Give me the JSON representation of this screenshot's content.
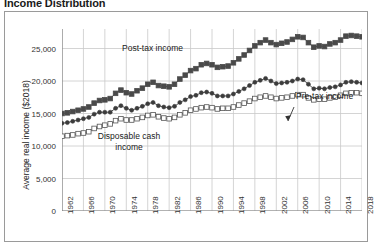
{
  "chart": {
    "title": "Income Distribution",
    "ylabel": "Average real income ($2018)",
    "xlabel": ""
  },
  "annotations": {
    "post_tax": "Post-tax income",
    "pre_tax": "Pre-tax income",
    "disposable": "Disposable cash income"
  },
  "axes": {
    "y_ticks": [
      "0",
      "5,000",
      "10,000",
      "15,000",
      "20,000",
      "25,000"
    ],
    "x_ticks": [
      "1962",
      "1966",
      "1970",
      "1974",
      "1978",
      "1982",
      "1986",
      "1990",
      "1994",
      "1998",
      "2002",
      "2006",
      "2010",
      "2014",
      "2018"
    ]
  },
  "colors": {
    "post_tax": "#4a4a4a",
    "pre_tax": "#3c3c3c",
    "disposable": "#ffffff",
    "disposable_stroke": "#555555",
    "grid": "#c9c9c9",
    "axis": "#7a7a7a",
    "frame": "#9a9a9a"
  },
  "chart_data": {
    "type": "line",
    "title": "Income Distribution",
    "xlabel": "",
    "ylabel": "Average real income ($2018)",
    "ylim": [
      0,
      28000
    ],
    "xlim": [
      1962,
      2018
    ],
    "grid": true,
    "legend": "annotations-inline",
    "markers": {
      "post_tax": "filled-square",
      "pre_tax": "filled-circle",
      "disposable": "open-square"
    },
    "x": [
      1962,
      1963,
      1964,
      1965,
      1966,
      1967,
      1968,
      1969,
      1970,
      1971,
      1972,
      1973,
      1974,
      1975,
      1976,
      1977,
      1978,
      1979,
      1980,
      1981,
      1982,
      1983,
      1984,
      1985,
      1986,
      1987,
      1988,
      1989,
      1990,
      1991,
      1992,
      1993,
      1994,
      1995,
      1996,
      1997,
      1998,
      1999,
      2000,
      2001,
      2002,
      2003,
      2004,
      2005,
      2006,
      2007,
      2008,
      2009,
      2010,
      2011,
      2012,
      2013,
      2014,
      2015,
      2016,
      2017,
      2018
    ],
    "series": [
      {
        "name": "Post-tax income",
        "values": [
          15000,
          15100,
          15300,
          15500,
          15700,
          16000,
          16600,
          17000,
          17100,
          17300,
          18100,
          18600,
          18200,
          18000,
          18500,
          18900,
          19500,
          19800,
          19300,
          19200,
          19100,
          19500,
          20300,
          20900,
          21600,
          21900,
          22500,
          22700,
          22500,
          22100,
          22200,
          22300,
          22800,
          23400,
          24000,
          24700,
          25400,
          25900,
          26300,
          25900,
          25600,
          25800,
          26000,
          26400,
          26800,
          26700,
          25900,
          25200,
          25400,
          25300,
          25700,
          25900,
          26300,
          26900,
          27000,
          26900,
          26800
        ]
      },
      {
        "name": "Pre-tax income",
        "values": [
          13500,
          13600,
          13800,
          14000,
          14200,
          14400,
          14900,
          15200,
          15200,
          15200,
          15800,
          16200,
          15800,
          15500,
          15800,
          16100,
          16500,
          16700,
          16200,
          16000,
          15900,
          16100,
          16700,
          17100,
          17600,
          17800,
          18200,
          18300,
          18100,
          17700,
          17700,
          17700,
          18000,
          18400,
          18800,
          19300,
          19800,
          20100,
          20400,
          20000,
          19600,
          19700,
          19800,
          20000,
          20300,
          20200,
          19500,
          18800,
          18900,
          18800,
          19000,
          19100,
          19400,
          19800,
          19900,
          19800,
          19700
        ]
      },
      {
        "name": "Disposable cash income",
        "values": [
          11500,
          11600,
          11700,
          11900,
          12000,
          12200,
          12700,
          13000,
          13200,
          13400,
          13900,
          14200,
          14000,
          14000,
          14200,
          14400,
          14700,
          14800,
          14500,
          14300,
          14200,
          14400,
          14800,
          15100,
          15500,
          15700,
          15900,
          16000,
          15900,
          15700,
          15800,
          15800,
          16000,
          16300,
          16600,
          16900,
          17300,
          17500,
          17700,
          17500,
          17300,
          17400,
          17500,
          17700,
          17900,
          17900,
          17400,
          17100,
          17200,
          17200,
          17400,
          17500,
          17800,
          18100,
          18200,
          18200,
          18100
        ]
      }
    ]
  }
}
